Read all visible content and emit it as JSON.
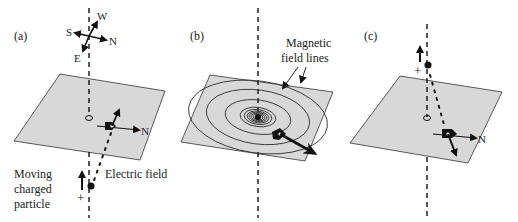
{
  "panels": [
    {
      "id": "a",
      "label": "(a)",
      "compass": {
        "west": "W",
        "south": "S",
        "north": "N",
        "east": "E"
      },
      "needle_label": "N",
      "electric_field_label": "Electric field",
      "particle_label": [
        "Moving",
        "charged",
        "particle"
      ],
      "charge_sign": "+"
    },
    {
      "id": "b",
      "label": "(b)",
      "field_label": [
        "Magnetic",
        "field lines"
      ]
    },
    {
      "id": "c",
      "label": "(c)",
      "needle_label": "N",
      "charge_sign": "+"
    }
  ],
  "colors": {
    "plate": "#d8d8d8",
    "ink": "#111111",
    "background": "#ffffff"
  }
}
